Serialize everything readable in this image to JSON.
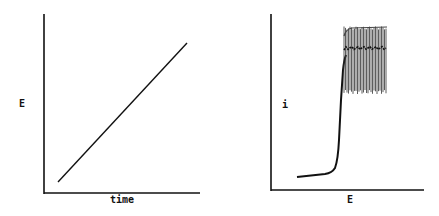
{
  "panels": [
    {
      "id": "left",
      "ylabel": "E",
      "xlabel": "time",
      "description": "Linear potential ramp versus time"
    },
    {
      "id": "right",
      "ylabel": "i",
      "xlabel": "E",
      "description": "Current versus potential: low baseline, sharp rise, then sustained oscillations"
    }
  ],
  "chart_data": [
    {
      "type": "line",
      "title": "",
      "xlabel": "time",
      "ylabel": "E",
      "grid": false,
      "series": [
        {
          "name": "E(t)",
          "x": [
            0.1,
            0.92
          ],
          "y": [
            0.07,
            0.84
          ]
        }
      ]
    },
    {
      "type": "line",
      "title": "",
      "xlabel": "E",
      "ylabel": "i",
      "grid": false,
      "series": [
        {
          "name": "baseline",
          "x": [
            0.17,
            0.37,
            0.43
          ],
          "y": [
            0.08,
            0.1,
            0.13
          ]
        },
        {
          "name": "rise",
          "x": [
            0.43,
            0.45,
            0.47,
            0.48
          ],
          "y": [
            0.13,
            0.3,
            0.6,
            0.75
          ]
        },
        {
          "name": "oscillation-band",
          "x_range": [
            0.48,
            0.76
          ],
          "y_upper": 0.89,
          "y_lower": 0.55,
          "y_center": 0.8
        }
      ]
    }
  ],
  "colors": {
    "ink": "#111111",
    "background": "#ffffff"
  }
}
